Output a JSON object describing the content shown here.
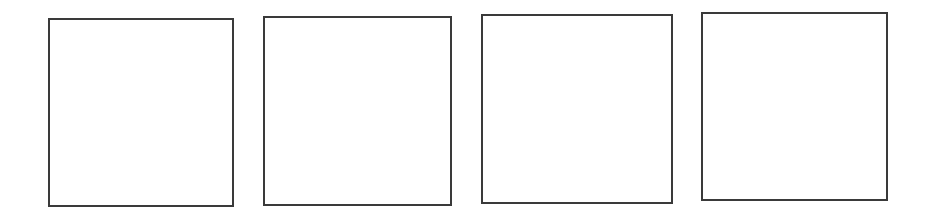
{
  "page": {
    "background_color": "#ffffff",
    "line_color": "#3a3a3a"
  },
  "panels": [
    {
      "index": 1,
      "label": "",
      "x": 48,
      "y": 18,
      "width": 186,
      "height": 189
    },
    {
      "index": 2,
      "label": "",
      "x": 263,
      "y": 16,
      "width": 189,
      "height": 190
    },
    {
      "index": 3,
      "label": "",
      "x": 481,
      "y": 14,
      "width": 192,
      "height": 190
    },
    {
      "index": 4,
      "label": "",
      "x": 701,
      "y": 12,
      "width": 187,
      "height": 189
    }
  ]
}
